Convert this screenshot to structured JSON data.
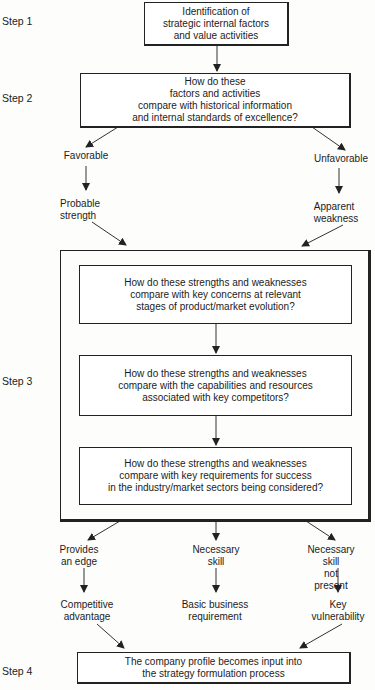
{
  "steps": {
    "step1": "Step 1",
    "step2": "Step 2",
    "step3": "Step 3",
    "step4": "Step 4"
  },
  "boxes": {
    "identify": "Identification of\nstrategic internal factors\nand value activities",
    "compare_history": "How do these\nfactors and activities\ncompare with historical information\nand internal standards of excellence?",
    "compare_evolution": "How do these strengths and weaknesses\ncompare with key concerns at relevant\nstages of product/market evolution?",
    "compare_competitors": "How do these strengths and weaknesses\ncompare with the capabilities and resources\nassociated with key competitors?",
    "compare_requirements": "How do these strengths and weaknesses\ncompare with key requirements for success\nin the industry/market sectors being considered?",
    "company_profile": "The company profile becomes input into\nthe strategy formulation process"
  },
  "branches": {
    "favorable": "Favorable",
    "unfavorable": "Unfavorable",
    "probable_strength": "Probable\nstrength",
    "apparent_weakness": "Apparent\nweakness",
    "provides_edge": "Provides\nan edge",
    "necessary_skill": "Necessary\nskill",
    "skill_not_present": "Necessary skill\nnot present",
    "competitive_advantage": "Competitive\nadvantage",
    "basic_requirement": "Basic business\nrequirement",
    "key_vulnerability": "Key\nvulnerability"
  }
}
